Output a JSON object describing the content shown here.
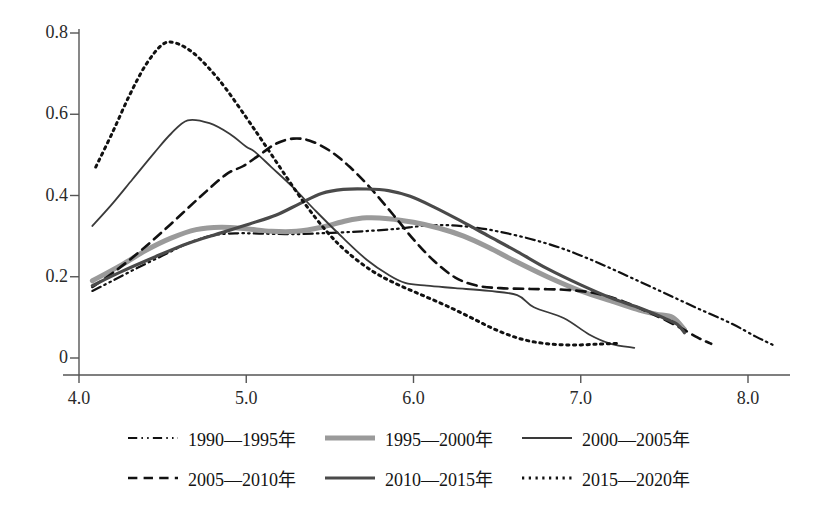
{
  "chart_data": {
    "type": "line",
    "title": "",
    "subtitle": "",
    "xlabel": "",
    "ylabel": "",
    "xlim": [
      3.95,
      8.25
    ],
    "ylim": [
      0,
      0.85
    ],
    "xticks": [
      "4.0",
      "5.0",
      "6.0",
      "7.0",
      "8.0"
    ],
    "xtick_values": [
      4.0,
      5.0,
      6.0,
      7.0,
      8.0
    ],
    "yticks": [
      "0",
      "0.2",
      "0.4",
      "0.6",
      "0.8"
    ],
    "ytick_values": [
      0,
      0.2,
      0.4,
      0.6,
      0.8
    ],
    "grid": false,
    "legend_position": "bottom",
    "series": [
      {
        "name": "1990—1995年",
        "style": "dash-dot-dot",
        "color": "#111111",
        "width": 2.2,
        "points": [
          [
            4.08,
            0.165
          ],
          [
            4.2,
            0.19
          ],
          [
            4.35,
            0.222
          ],
          [
            4.5,
            0.252
          ],
          [
            4.65,
            0.282
          ],
          [
            4.8,
            0.302
          ],
          [
            4.95,
            0.307
          ],
          [
            5.1,
            0.306
          ],
          [
            5.3,
            0.305
          ],
          [
            5.5,
            0.308
          ],
          [
            5.7,
            0.312
          ],
          [
            5.9,
            0.318
          ],
          [
            6.05,
            0.325
          ],
          [
            6.2,
            0.327
          ],
          [
            6.35,
            0.322
          ],
          [
            6.5,
            0.312
          ],
          [
            6.7,
            0.293
          ],
          [
            6.9,
            0.268
          ],
          [
            7.1,
            0.235
          ],
          [
            7.3,
            0.198
          ],
          [
            7.5,
            0.16
          ],
          [
            7.7,
            0.122
          ],
          [
            7.9,
            0.085
          ],
          [
            8.05,
            0.052
          ],
          [
            8.15,
            0.032
          ]
        ]
      },
      {
        "name": "1995—2000年",
        "style": "solid",
        "color": "#9a9a9a",
        "width": 5.0,
        "points": [
          [
            4.08,
            0.19
          ],
          [
            4.25,
            0.228
          ],
          [
            4.4,
            0.265
          ],
          [
            4.55,
            0.295
          ],
          [
            4.7,
            0.316
          ],
          [
            4.85,
            0.322
          ],
          [
            5.0,
            0.318
          ],
          [
            5.15,
            0.312
          ],
          [
            5.3,
            0.312
          ],
          [
            5.45,
            0.322
          ],
          [
            5.6,
            0.338
          ],
          [
            5.72,
            0.345
          ],
          [
            5.85,
            0.343
          ],
          [
            6.0,
            0.334
          ],
          [
            6.15,
            0.32
          ],
          [
            6.3,
            0.3
          ],
          [
            6.45,
            0.272
          ],
          [
            6.6,
            0.24
          ],
          [
            6.8,
            0.2
          ],
          [
            7.0,
            0.165
          ],
          [
            7.2,
            0.138
          ],
          [
            7.35,
            0.118
          ],
          [
            7.45,
            0.108
          ],
          [
            7.55,
            0.1
          ],
          [
            7.62,
            0.07
          ]
        ]
      },
      {
        "name": "2000—2005年",
        "style": "solid",
        "color": "#3a3a3a",
        "width": 1.8,
        "points": [
          [
            4.08,
            0.325
          ],
          [
            4.2,
            0.38
          ],
          [
            4.32,
            0.44
          ],
          [
            4.45,
            0.505
          ],
          [
            4.55,
            0.552
          ],
          [
            4.65,
            0.585
          ],
          [
            4.78,
            0.578
          ],
          [
            4.9,
            0.552
          ],
          [
            5.0,
            0.52
          ],
          [
            5.05,
            0.508
          ],
          [
            5.15,
            0.47
          ],
          [
            5.28,
            0.42
          ],
          [
            5.42,
            0.36
          ],
          [
            5.58,
            0.295
          ],
          [
            5.72,
            0.242
          ],
          [
            5.85,
            0.205
          ],
          [
            5.95,
            0.185
          ],
          [
            6.08,
            0.178
          ],
          [
            6.25,
            0.172
          ],
          [
            6.45,
            0.165
          ],
          [
            6.62,
            0.155
          ],
          [
            6.72,
            0.125
          ],
          [
            6.9,
            0.098
          ],
          [
            7.05,
            0.058
          ],
          [
            7.18,
            0.035
          ],
          [
            7.32,
            0.025
          ]
        ]
      },
      {
        "name": "2005—2010年",
        "style": "dashed",
        "color": "#111111",
        "width": 2.6,
        "points": [
          [
            4.08,
            0.175
          ],
          [
            4.22,
            0.215
          ],
          [
            4.38,
            0.268
          ],
          [
            4.55,
            0.33
          ],
          [
            4.72,
            0.395
          ],
          [
            4.88,
            0.452
          ],
          [
            4.98,
            0.472
          ],
          [
            5.08,
            0.5
          ],
          [
            5.18,
            0.528
          ],
          [
            5.28,
            0.54
          ],
          [
            5.38,
            0.535
          ],
          [
            5.5,
            0.51
          ],
          [
            5.62,
            0.47
          ],
          [
            5.75,
            0.415
          ],
          [
            5.88,
            0.352
          ],
          [
            6.0,
            0.292
          ],
          [
            6.12,
            0.24
          ],
          [
            6.25,
            0.198
          ],
          [
            6.38,
            0.178
          ],
          [
            6.52,
            0.172
          ],
          [
            6.7,
            0.17
          ],
          [
            6.9,
            0.168
          ],
          [
            7.08,
            0.16
          ],
          [
            7.25,
            0.14
          ],
          [
            7.42,
            0.11
          ],
          [
            7.58,
            0.078
          ],
          [
            7.7,
            0.05
          ],
          [
            7.78,
            0.035
          ]
        ]
      },
      {
        "name": "2010—2015年",
        "style": "solid",
        "color": "#4a4a4a",
        "width": 3.2,
        "points": [
          [
            4.08,
            0.178
          ],
          [
            4.25,
            0.212
          ],
          [
            4.45,
            0.248
          ],
          [
            4.65,
            0.282
          ],
          [
            4.85,
            0.308
          ],
          [
            5.02,
            0.33
          ],
          [
            5.18,
            0.352
          ],
          [
            5.32,
            0.38
          ],
          [
            5.45,
            0.405
          ],
          [
            5.58,
            0.415
          ],
          [
            5.72,
            0.416
          ],
          [
            5.85,
            0.412
          ],
          [
            5.98,
            0.398
          ],
          [
            6.12,
            0.372
          ],
          [
            6.28,
            0.338
          ],
          [
            6.45,
            0.3
          ],
          [
            6.62,
            0.262
          ],
          [
            6.8,
            0.22
          ],
          [
            7.0,
            0.18
          ],
          [
            7.18,
            0.148
          ],
          [
            7.32,
            0.128
          ],
          [
            7.42,
            0.112
          ],
          [
            7.5,
            0.098
          ],
          [
            7.58,
            0.082
          ],
          [
            7.62,
            0.062
          ]
        ]
      },
      {
        "name": "2015—2020年",
        "style": "dotted",
        "color": "#111111",
        "width": 3.0,
        "points": [
          [
            4.1,
            0.47
          ],
          [
            4.2,
            0.555
          ],
          [
            4.3,
            0.645
          ],
          [
            4.4,
            0.722
          ],
          [
            4.5,
            0.772
          ],
          [
            4.58,
            0.775
          ],
          [
            4.68,
            0.752
          ],
          [
            4.78,
            0.712
          ],
          [
            4.88,
            0.662
          ],
          [
            5.0,
            0.592
          ],
          [
            5.1,
            0.532
          ],
          [
            5.22,
            0.458
          ],
          [
            5.35,
            0.38
          ],
          [
            5.48,
            0.312
          ],
          [
            5.6,
            0.262
          ],
          [
            5.75,
            0.215
          ],
          [
            5.9,
            0.182
          ],
          [
            6.05,
            0.155
          ],
          [
            6.2,
            0.128
          ],
          [
            6.35,
            0.098
          ],
          [
            6.5,
            0.068
          ],
          [
            6.65,
            0.046
          ],
          [
            6.8,
            0.035
          ],
          [
            6.95,
            0.032
          ],
          [
            7.1,
            0.034
          ],
          [
            7.22,
            0.036
          ]
        ]
      }
    ]
  },
  "axes": {
    "y_tick_labels": [
      "0.8",
      "0.6",
      "0.4",
      "0.2",
      "0"
    ],
    "x_tick_labels": [
      "4.0",
      "5.0",
      "6.0",
      "7.0",
      "8.0"
    ]
  },
  "legend": {
    "rows": [
      [
        {
          "label": "1990—1995年",
          "key": "dash-dot-dot",
          "color": "#111111",
          "width": 2.2
        },
        {
          "label": "1995—2000年",
          "key": "solid",
          "color": "#9a9a9a",
          "width": 5.0
        },
        {
          "label": "2000—2005年",
          "key": "solid",
          "color": "#3a3a3a",
          "width": 1.8
        }
      ],
      [
        {
          "label": "2005—2010年",
          "key": "dashed",
          "color": "#111111",
          "width": 2.6
        },
        {
          "label": "2010—2015年",
          "key": "solid",
          "color": "#4a4a4a",
          "width": 3.2
        },
        {
          "label": "2015—2020年",
          "key": "dotted",
          "color": "#111111",
          "width": 3.0
        }
      ]
    ]
  }
}
